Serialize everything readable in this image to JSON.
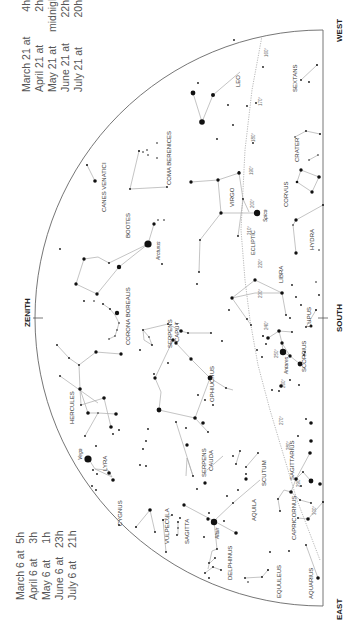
{
  "directions": {
    "zenith": "ZENITH",
    "west": "WEST",
    "south": "SOUTH",
    "east": "EAST"
  },
  "times_top": [
    {
      "date": "March 21 at",
      "time": "4h"
    },
    {
      "date": "April 21 at",
      "time": "2h"
    },
    {
      "date": "May 21 at",
      "time": "midnight"
    },
    {
      "date": "June 21 at",
      "time": "22h"
    },
    {
      "date": "July 21 at",
      "time": "20h"
    }
  ],
  "times_bottom": [
    {
      "date": "March 6 at",
      "time": "5h"
    },
    {
      "date": "April 6 at",
      "time": "3h"
    },
    {
      "date": "May 6 at",
      "time": "1h"
    },
    {
      "date": "June 6 at",
      "time": "23h"
    },
    {
      "date": "July 6 at",
      "time": "21h"
    }
  ],
  "ecliptic_label": "ECLIPTIC",
  "ecliptic_marks": [
    "160°",
    "170°",
    "180°",
    "190°",
    "200°",
    "210°",
    "220°",
    "230°",
    "240°",
    "250°",
    "260°",
    "270°",
    "280°",
    "290°",
    "300°"
  ],
  "constellations": [
    "LEO",
    "SEXTANS",
    "COMA BERENICES",
    "CRATER",
    "CANES VENATICI",
    "VIRGO",
    "CORVUS",
    "BOOTES",
    "HYDRA",
    "LIBRA",
    "CORONA BOREALIS",
    "SERPENS CAPUT",
    "LUPUS",
    "HERCULES",
    "OPHIUCHUS",
    "SCORPIUS",
    "LYRA",
    "SERPENS CAUDA",
    "SCUTUM",
    "SAGITTARIUS",
    "CYGNUS",
    "VULPECULA",
    "SAGITTA",
    "AQUILA",
    "CAPRICORNUS",
    "DELPHINUS",
    "EQUULEUS",
    "AQUARIUS"
  ],
  "named_stars": [
    "Arcturus",
    "Spica",
    "Antares",
    "Vega",
    "Altair"
  ]
}
